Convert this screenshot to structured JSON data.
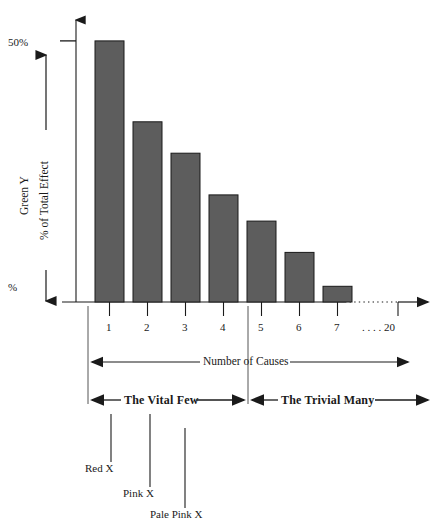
{
  "chart_data": {
    "type": "bar",
    "title": "",
    "subtitle": "",
    "xlabel": "Number of  Causes",
    "ylabel": "% of Total Effect",
    "ylabel_secondary": "Green Y",
    "categories": [
      "1",
      "2",
      "3",
      "4",
      "5",
      "6",
      "7"
    ],
    "values": [
      50,
      34.5,
      28.5,
      20.5,
      15.5,
      9.5,
      3
    ],
    "ylim": [
      0,
      54
    ],
    "xlim_label_extra": ". . . . 20",
    "grid": false,
    "legend": "none",
    "bar_color": "#5d5d5d",
    "bar_edge_color": "#1a1a1a",
    "axis_color": "#1a1a1a",
    "y_ticks": [
      {
        "label": "50%",
        "value": 50
      },
      {
        "label": "%",
        "value": 0
      }
    ],
    "x_tick_labels": [
      "1",
      "2",
      "3",
      "4",
      "5",
      "6",
      "7",
      ". . . . 20"
    ],
    "annotations": [
      {
        "name": "vital-few",
        "label": "The Vital Few",
        "span": [
          "1",
          "4"
        ]
      },
      {
        "name": "trivial-many",
        "label": "The Trivial Many",
        "span": [
          "5",
          "20"
        ]
      },
      {
        "name": "red-x",
        "label": "Red X",
        "points_to": "1"
      },
      {
        "name": "pink-x",
        "label": "Pink X",
        "points_to": "2"
      },
      {
        "name": "pale-pink-x",
        "label": "Pale Pink X",
        "points_to": "3"
      }
    ]
  },
  "axes": {
    "y_top_label": "50%",
    "y_bottom_label": "%",
    "y_axis_title_1": "Green Y",
    "y_axis_title_2": "% of Total Effect",
    "x_axis_title": "Number of  Causes"
  },
  "x_labels": {
    "c1": "1",
    "c2": "2",
    "c3": "3",
    "c4": "4",
    "c5": "5",
    "c6": "6",
    "c7": "7",
    "c20": ". . . . 20"
  },
  "bands": {
    "vital_few": "The Vital Few",
    "trivial_many": "The Trivial Many"
  },
  "callouts": {
    "red_x": "Red X",
    "pink_x": "Pink X",
    "pale_pink_x": "Pale Pink X"
  }
}
